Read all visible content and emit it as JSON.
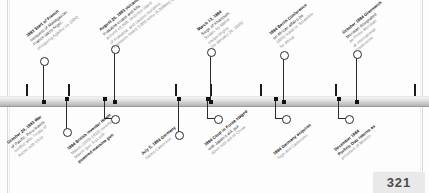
{
  "page": {
    "folio": "321",
    "type": "timeline-spread"
  },
  "timeline": {
    "orientation": "horizontal",
    "spine_color": "#c9c9c9",
    "tick_color": "#1a1a1a",
    "marker_shapes": [
      "circle",
      "square"
    ]
  },
  "events_above": [
    {
      "id": "madagascar-niger",
      "date": "1883",
      "lines": [
        "1883 Start of French",
        "conquest of Madagascar,",
        "France takes Niger,",
        "occupying Agadez (in 1904)"
      ],
      "bold_date": "1883",
      "bold_terms": [
        "Madagascar",
        "Niger"
      ]
    },
    {
      "id": "krakatoa",
      "date": "August 26, 1883",
      "lines": [
        "August 26, 1883 Volcano",
        "Krakatoa erupts and kills",
        "around 40,000, destroys island",
        "of Krakatoa, and causes tsunamis,",
        "explosion heard 3,000 miles (5,000km) away"
      ],
      "bold_date": "August 26, 1883 Volcano",
      "bold_terms": []
    },
    {
      "id": "siege-khartoum",
      "date": "March 13, 1884",
      "lines": [
        "March 13, 1884",
        "Siege of Khartoum,",
        "Sudan, by Mahdi",
        "troops begins",
        "(to January 26, 1885)"
      ],
      "bold_date": "March 13, 1884",
      "bold_terms": []
    },
    {
      "id": "berlin-conference",
      "date": "1884",
      "lines": [
        "1884 Berlin Conference",
        "on African affairs (to",
        "1885) leads to 'Scramble",
        "for Africa'"
      ],
      "bold_date": "1884 Berlin Conference",
      "bold_terms": []
    },
    {
      "id": "greenwich-meridian",
      "date": "October 1884",
      "lines": [
        "October 1884 Greenwich",
        "Meridian designated",
        "as Prime Meridian",
        "at international",
        "conference"
      ],
      "bold_date": "October 1884 Greenwich",
      "bold_terms": []
    }
  ],
  "events_below": [
    {
      "id": "war-of-pacific",
      "date": "October 20, 1883",
      "lines": [
        "October 20, 1883 War",
        "of Pacific, Peru leaves",
        "conflict after Treaty of",
        "Ancon with Chile"
      ],
      "bold_date": "October 20, 1883 War",
      "bold_terms": []
    },
    {
      "id": "maxim-gun",
      "date": "1884",
      "lines": [
        "1884 British inventor Hiram",
        "Maxim (1840-1916) invents",
        "Maxim gun, first self-",
        "powered machine gun"
      ],
      "bold_date": "1884",
      "bold_terms": [
        "Hiram",
        "Maxim gun, first self-",
        "powered machine gun"
      ]
    },
    {
      "id": "germany-cameroon",
      "date": "July 5, 1884",
      "lines": [
        "July 5, 1884 Germany",
        "claims Cameroon"
      ],
      "bold_date": "July 5, 1884 Germany",
      "bold_terms": []
    },
    {
      "id": "korea-coup",
      "date": "1884",
      "lines": [
        "1884 Coup in Korea staged",
        "with Japan's aid, put",
        "down with aid of China"
      ],
      "bold_date": "1884 Coup in Korea",
      "bold_terms": []
    },
    {
      "id": "togo-cameroon",
      "date": "1884",
      "lines": [
        "1884 Germany acquires",
        "Togo and Cameroon"
      ],
      "bold_date": "1884 Germany",
      "bold_terms": []
    },
    {
      "id": "porfirio-diaz",
      "date": "December 1884",
      "lines": [
        "December 1884",
        "Porfirio Diaz returns as",
        "president of Mexico"
      ],
      "bold_date": "December 1884",
      "bold_terms": [
        "Porfirio Diaz"
      ]
    }
  ]
}
